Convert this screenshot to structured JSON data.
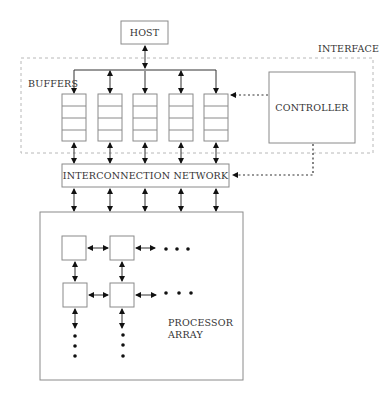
{
  "diagram": {
    "title_fragment": "",
    "host": {
      "label": "HOST"
    },
    "interface": {
      "label": "INTERFACE"
    },
    "buffers": {
      "label": "BUFFERS",
      "count": 5,
      "slots_per_buffer": 4
    },
    "controller": {
      "label": "CONTROLLER"
    },
    "network": {
      "label": "INTERCONNECTION NETWORK"
    },
    "processor_array": {
      "label_line1": "PROCESSOR",
      "label_line2": "ARRAY",
      "visible_pe_rows": 2,
      "visible_pe_cols": 2
    },
    "colors": {
      "stroke": "#333333",
      "box_border": "#8a8a8a",
      "dashed_border": "#b8b8b8",
      "text": "#333333"
    }
  }
}
